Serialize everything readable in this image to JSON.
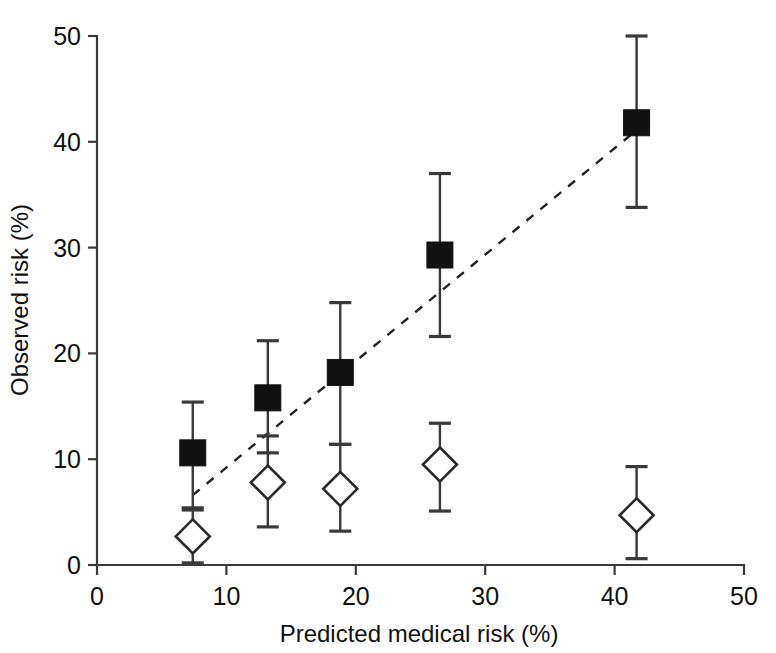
{
  "chart_data": {
    "type": "scatter",
    "title": "",
    "xlabel": "Predicted medical risk (%)",
    "ylabel": "Observed risk (%)",
    "xlim": [
      0,
      50
    ],
    "ylim": [
      0,
      50
    ],
    "xticks": [
      0,
      10,
      20,
      30,
      40,
      50
    ],
    "yticks": [
      0,
      10,
      20,
      30,
      40,
      50
    ],
    "xtick_labels": [
      "0",
      "10",
      "20",
      "30",
      "40",
      "50"
    ],
    "ytick_labels": [
      "0",
      "10",
      "20",
      "30",
      "40",
      "50"
    ],
    "grid": false,
    "legend": "none",
    "annotations": [
      {
        "name": "identity-reference-line",
        "style": "dashed",
        "x_start": 7.4,
        "y_start": 6.6,
        "x_end": 41.7,
        "y_end": 41.1
      }
    ],
    "series": [
      {
        "name": "Observed risk (filled squares)",
        "marker": "filled-square",
        "x": [
          7.4,
          13.2,
          18.8,
          26.5,
          41.7
        ],
        "y": [
          10.6,
          15.8,
          18.2,
          29.3,
          41.8
        ],
        "y_err_low": [
          5.2,
          10.6,
          11.4,
          21.6,
          33.8
        ],
        "y_err_high": [
          15.4,
          21.2,
          24.8,
          37.0,
          50.0
        ]
      },
      {
        "name": "Observed risk (open diamonds)",
        "marker": "open-diamond",
        "x": [
          7.4,
          13.2,
          18.8,
          26.5,
          41.7
        ],
        "y": [
          2.7,
          7.8,
          7.2,
          9.5,
          4.7
        ],
        "y_err_low": [
          0.2,
          3.6,
          3.2,
          5.1,
          0.6
        ],
        "y_err_high": [
          5.4,
          12.2,
          11.4,
          13.4,
          9.3
        ]
      }
    ]
  },
  "figure": {
    "caption": ""
  }
}
